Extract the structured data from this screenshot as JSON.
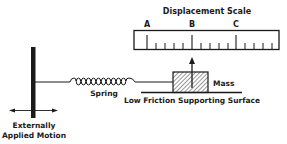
{
  "diagram": {
    "scale": {
      "title": "Displacement Scale",
      "marks": [
        {
          "label": "A",
          "x": 147
        },
        {
          "label": "B",
          "x": 192
        },
        {
          "label": "C",
          "x": 236
        }
      ]
    },
    "mass_label": "Mass",
    "spring_label": "Spring",
    "surface_label": "Low Friction Supporting Surface",
    "motion_label_line1": "Externally",
    "motion_label_line2": "Applied Motion",
    "colors": {
      "ink": "#1a1a1a",
      "background": "#ffffff"
    }
  }
}
